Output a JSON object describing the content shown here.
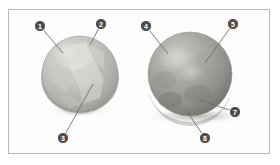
{
  "figure": {
    "frame": {
      "border_color": "#b9b9b9",
      "background_color": "#fdfdfd"
    },
    "background_color": "#ffffff",
    "callout": {
      "badge_fill": "#4d4d4d",
      "badge_stroke": "#ffffff",
      "leader_color": "#6e6e6e",
      "label_color": "#ffffff"
    },
    "objects": [
      {
        "name": "left-sphere",
        "description": "light gray faceted crystalline sphere",
        "base_color": "#b5b5b3",
        "highlight_color": "#dedcd8",
        "shadow_color": "#8e8e8c",
        "cx": 80,
        "cy": 75,
        "rx": 39,
        "ry": 38
      },
      {
        "name": "right-sphere",
        "description": "medium gray mottled sphere resting on a surface with cast shadow",
        "base_color": "#9b9b99",
        "highlight_color": "#cfcdc8",
        "shadow_color": "#6f6f6d",
        "cast_shadow_color": "#c9c9c6",
        "cx": 190,
        "cy": 75,
        "rx": 42,
        "ry": 42
      }
    ],
    "callouts": [
      {
        "id": "callout-1",
        "label": "1",
        "target_object": "left-sphere",
        "badge_x": 40,
        "badge_y": 26,
        "line_end_x": 63,
        "line_end_y": 53
      },
      {
        "id": "callout-2",
        "label": "2",
        "target_object": "left-sphere",
        "badge_x": 101,
        "badge_y": 24,
        "line_end_x": 90,
        "line_end_y": 45
      },
      {
        "id": "callout-3",
        "label": "3",
        "target_object": "left-sphere",
        "badge_x": 63,
        "badge_y": 138,
        "line_end_x": 93,
        "line_end_y": 84
      },
      {
        "id": "callout-4",
        "label": "4",
        "target_object": "right-sphere",
        "badge_x": 146,
        "badge_y": 26,
        "line_end_x": 168,
        "line_end_y": 54
      },
      {
        "id": "callout-5",
        "label": "5",
        "target_object": "right-sphere",
        "badge_x": 233,
        "badge_y": 24,
        "line_end_x": 205,
        "line_end_y": 63
      },
      {
        "id": "callout-7",
        "label": "7",
        "target_object": "right-sphere",
        "badge_x": 235,
        "badge_y": 112,
        "line_end_x": 200,
        "line_end_y": 100
      },
      {
        "id": "callout-8",
        "label": "8",
        "target_object": "right-sphere",
        "badge_x": 205,
        "badge_y": 138,
        "line_end_x": 186,
        "line_end_y": 110
      }
    ]
  }
}
